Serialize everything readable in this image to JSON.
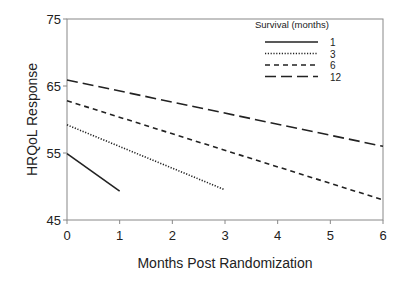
{
  "chart_data": {
    "type": "line",
    "title": "",
    "xlabel": "Months Post Randomization",
    "ylabel": "HRQoL Response",
    "xlim": [
      0,
      6
    ],
    "ylim": [
      45,
      75
    ],
    "xticks": [
      0,
      1,
      2,
      3,
      4,
      5,
      6
    ],
    "yticks": [
      45,
      55,
      65,
      75
    ],
    "grid": false,
    "legend": {
      "title": "Survival  (months)",
      "position": "upper right",
      "entries": [
        "1",
        "3",
        "6",
        "12"
      ]
    },
    "series": [
      {
        "name": "1",
        "style": "solid",
        "x": [
          0,
          1
        ],
        "y": [
          54.9,
          49.3
        ]
      },
      {
        "name": "3",
        "style": "dotted",
        "x": [
          0,
          3
        ],
        "y": [
          59.2,
          49.5
        ]
      },
      {
        "name": "6",
        "style": "short-dash",
        "x": [
          0,
          6
        ],
        "y": [
          62.8,
          48.0
        ]
      },
      {
        "name": "12",
        "style": "long-dash",
        "x": [
          0,
          6
        ],
        "y": [
          65.9,
          56.0
        ]
      }
    ]
  }
}
